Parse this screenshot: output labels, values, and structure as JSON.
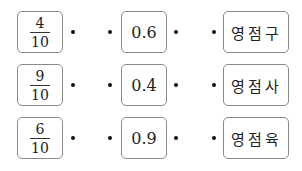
{
  "rows": [
    {
      "fraction": {
        "numerator": "4",
        "denominator": "10"
      },
      "decimal": "0.6",
      "word": "영점구"
    },
    {
      "fraction": {
        "numerator": "9",
        "denominator": "10"
      },
      "decimal": "0.4",
      "word": "영점사"
    },
    {
      "fraction": {
        "numerator": "6",
        "denominator": "10"
      },
      "decimal": "0.9",
      "word": "영점육"
    }
  ],
  "colors": {
    "border": "#8a8a8a",
    "text": "#222222",
    "dot": "#111111"
  }
}
